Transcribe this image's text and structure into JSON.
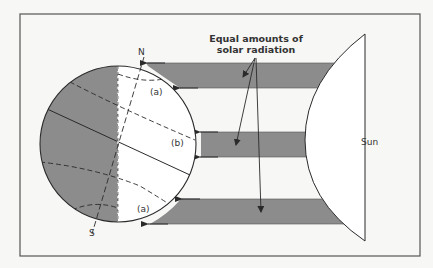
{
  "figure": {
    "labels": {
      "north": "N",
      "south": "S",
      "zone_a_top": "(a)",
      "zone_b": "(b)",
      "zone_a_bottom": "(a)",
      "sun": "Sun",
      "callout_line1": "Equal amounts of",
      "callout_line2": "solar radiation"
    },
    "colors": {
      "background": "#f7f7f5",
      "frame": "#555555",
      "shade": "#8c8c8c",
      "line": "#2a2a2a"
    },
    "beams": [
      {
        "name": "top",
        "target_zone": "(a)"
      },
      {
        "name": "middle",
        "target_zone": "(b)"
      },
      {
        "name": "bottom",
        "target_zone": "(a)"
      }
    ]
  }
}
